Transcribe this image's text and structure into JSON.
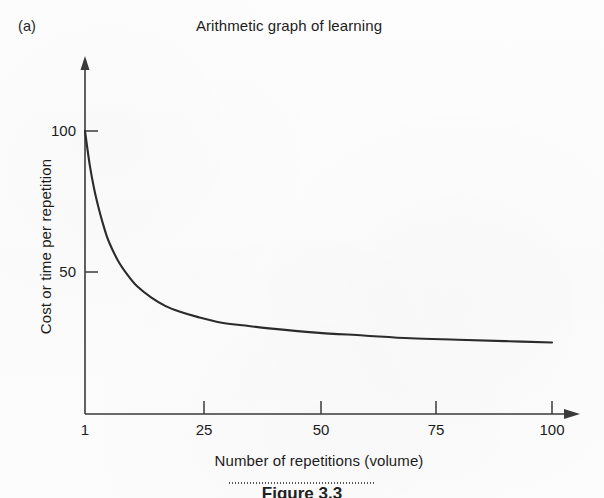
{
  "figure": {
    "panel_label": "(a)",
    "title": "Arithmetic graph of learning",
    "caption": "Figure 3.3"
  },
  "chart_data": {
    "type": "line",
    "title": "Arithmetic graph of learning",
    "xlabel": "Number of repetitions (volume)",
    "ylabel": "Cost or time per repetition",
    "xlim": [
      1,
      100
    ],
    "ylim": [
      0,
      110
    ],
    "xticks": [
      1,
      25,
      50,
      75,
      100
    ],
    "xtick_labels": [
      "1",
      "25",
      "50",
      "75",
      "100"
    ],
    "yticks": [
      50,
      100
    ],
    "ytick_labels": [
      "50",
      "100"
    ],
    "grid": false,
    "legend": "none",
    "series": [
      {
        "name": "Learning curve",
        "color": "#2b2b2b",
        "x": [
          1,
          2,
          3,
          4,
          5,
          6,
          8,
          10,
          12,
          15,
          18,
          21,
          25,
          30,
          35,
          40,
          50,
          60,
          70,
          80,
          90,
          100
        ],
        "y": [
          100,
          88,
          79,
          72,
          66,
          61,
          54,
          49,
          45,
          41,
          38,
          36,
          34,
          32,
          31,
          30,
          28.5,
          27.5,
          26.5,
          26,
          25.5,
          25
        ]
      }
    ],
    "annotations": []
  },
  "axes": {
    "y_tick_100": "100",
    "y_tick_50": "50",
    "x_tick_1": "1",
    "x_tick_25": "25",
    "x_tick_50": "50",
    "x_tick_75": "75",
    "x_tick_100": "100",
    "x_title": "Number of repetitions (volume)",
    "y_title": "Cost or time per repetition"
  },
  "colors": {
    "curve": "#2b2b2b",
    "axis": "#3a3a3a",
    "text": "#1c1c1c",
    "background": "#fdfdfd"
  }
}
